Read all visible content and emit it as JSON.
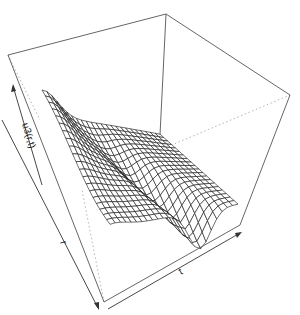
{
  "chart_data": {
    "type": "surface",
    "title": "",
    "zlabel": "u3(r,t)",
    "xlabel": "r",
    "ylabel": "t",
    "grid_resolution": [
      20,
      24
    ],
    "box": true,
    "axes_ticks": false,
    "colors": {
      "mesh": "#111111",
      "box": "#555555",
      "hidden": "#aaaaaa",
      "background": "#ffffff"
    }
  },
  "labels": {
    "z_axis": "u3(r,t)",
    "r_axis": "r",
    "t_axis": "t"
  }
}
